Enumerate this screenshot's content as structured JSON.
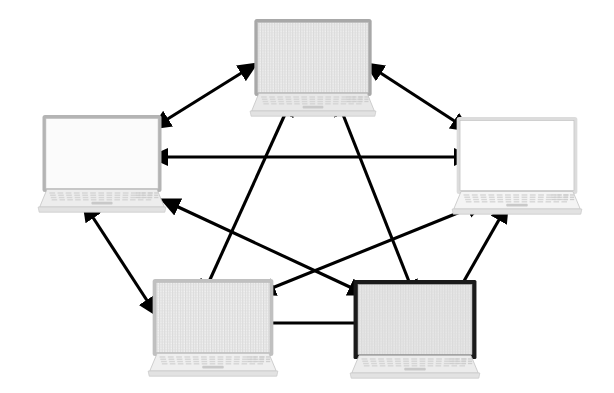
{
  "diagram": {
    "type": "node-link-diagram",
    "background_color": "#ffffff",
    "edge_color": "#000000",
    "node_count": 5,
    "edge_count": 9,
    "topology": "fully-connected-mesh",
    "nodes": [
      {
        "id": "laptop-top",
        "label": "top-laptop",
        "position": {
          "x": 248,
          "y": 18
        },
        "size": {
          "width": 130,
          "height": 100
        },
        "screen_style": "striped",
        "bezel_color": "#a8a8a8",
        "screen_color": "#f0f0f0",
        "body_color": "#e8e8e8",
        "shade": "medium-light"
      },
      {
        "id": "laptop-left",
        "label": "left-laptop",
        "position": {
          "x": 36,
          "y": 114
        },
        "size": {
          "width": 132,
          "height": 100
        },
        "screen_style": "plain",
        "bezel_color": "#b4b4b4",
        "screen_color": "#fbfbfb",
        "body_color": "#ededed",
        "shade": "light"
      },
      {
        "id": "laptop-right",
        "label": "right-laptop",
        "position": {
          "x": 450,
          "y": 116
        },
        "size": {
          "width": 134,
          "height": 100
        },
        "screen_style": "plain",
        "bezel_color": "#dcdcdc",
        "screen_color": "#ffffff",
        "body_color": "#f4f4f4",
        "shade": "very-light"
      },
      {
        "id": "laptop-bottom-left",
        "label": "bottom-left-laptop",
        "position": {
          "x": 146,
          "y": 278
        },
        "size": {
          "width": 134,
          "height": 100
        },
        "screen_style": "striped",
        "bezel_color": "#c0c0c0",
        "screen_color": "#f2f2f2",
        "body_color": "#efefef",
        "shade": "light"
      },
      {
        "id": "laptop-bottom-right",
        "label": "bottom-right-laptop",
        "position": {
          "x": 348,
          "y": 280
        },
        "size": {
          "width": 134,
          "height": 100
        },
        "screen_style": "striped",
        "bezel_color": "#1a1a1a",
        "screen_color": "#e9e9e9",
        "body_color": "#ececec",
        "shade": "dark"
      }
    ],
    "edges": [
      {
        "id": "edge-top-left",
        "from": "laptop-top",
        "to": "laptop-left",
        "arrow": "double",
        "x1": 243,
        "y1": 72,
        "x2": 166,
        "y2": 120
      },
      {
        "id": "edge-top-right",
        "from": "laptop-top",
        "to": "laptop-right",
        "arrow": "double",
        "x1": 379,
        "y1": 72,
        "x2": 456,
        "y2": 122
      },
      {
        "id": "edge-left-right",
        "from": "laptop-left",
        "to": "laptop-right",
        "arrow": "double",
        "x1": 166,
        "y1": 157,
        "x2": 456,
        "y2": 157
      },
      {
        "id": "edge-left-bottomleft",
        "from": "laptop-left",
        "to": "laptop-bottom-left",
        "arrow": "double",
        "x1": 92,
        "y1": 216,
        "x2": 148,
        "y2": 302
      },
      {
        "id": "edge-right-bottomright",
        "from": "laptop-right",
        "to": "laptop-bottom-right",
        "arrow": "double",
        "x1": 500,
        "y1": 218,
        "x2": 452,
        "y2": 302
      },
      {
        "id": "edge-bottomleft-bottomright",
        "from": "laptop-bottom-left",
        "to": "laptop-bottom-right",
        "arrow": "double",
        "x1": 268,
        "y1": 323,
        "x2": 356,
        "y2": 323
      },
      {
        "id": "edge-top-bottomleft",
        "from": "laptop-top",
        "to": "laptop-bottom-left",
        "arrow": "double",
        "x1": 286,
        "y1": 112,
        "x2": 208,
        "y2": 284
      },
      {
        "id": "edge-top-bottomright",
        "from": "laptop-top",
        "to": "laptop-bottom-right",
        "arrow": "double",
        "x1": 342,
        "y1": 112,
        "x2": 410,
        "y2": 284
      },
      {
        "id": "edge-left-bottomright",
        "from": "laptop-left",
        "to": "laptop-bottom-right",
        "arrow": "double",
        "x1": 176,
        "y1": 206,
        "x2": 352,
        "y2": 288
      },
      {
        "id": "edge-right-bottomleft",
        "from": "laptop-right",
        "to": "laptop-bottom-left",
        "arrow": "double",
        "x1": 470,
        "y1": 208,
        "x2": 272,
        "y2": 288
      }
    ]
  }
}
